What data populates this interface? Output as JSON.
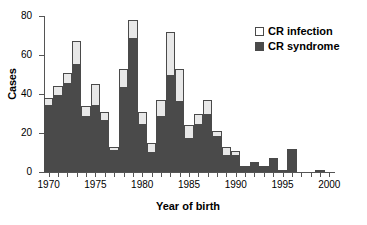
{
  "chart_data": {
    "type": "bar",
    "subtype": "stacked",
    "title": "",
    "xlabel": "Year of birth",
    "ylabel": "Cases",
    "xlim": [
      1969.5,
      2000.5
    ],
    "ylim": [
      0,
      80
    ],
    "yticks": [
      0,
      20,
      40,
      60,
      80
    ],
    "ytick_labels": [
      "0",
      "20",
      "40",
      "60",
      "80"
    ],
    "xtick_labels": [
      "1970",
      "1975",
      "1980",
      "1985",
      "1990",
      "1995",
      "2000"
    ],
    "xticks_major": [
      1970,
      1975,
      1980,
      1985,
      1990,
      1995,
      2000
    ],
    "xticks_minor_every": 1,
    "grid": false,
    "legend_position": "top-right",
    "categories": [
      "1970",
      "1971",
      "1972",
      "1973",
      "1974",
      "1975",
      "1976",
      "1977",
      "1978",
      "1979",
      "1980",
      "1981",
      "1982",
      "1983",
      "1984",
      "1985",
      "1986",
      "1987",
      "1988",
      "1989",
      "1990",
      "1991",
      "1992",
      "1993",
      "1994",
      "1995",
      "1996",
      "1997",
      "1998",
      "1999",
      "2000"
    ],
    "series": [
      {
        "name": "CR syndrome",
        "color": "#4a4a4a",
        "values": [
          34,
          39,
          45,
          55,
          28,
          34,
          26,
          11,
          43,
          68,
          24,
          10,
          28,
          49,
          36,
          17,
          24,
          29,
          18,
          8,
          8,
          3,
          5,
          2,
          6,
          1,
          11,
          0,
          0,
          1,
          0
        ]
      },
      {
        "name": "CR infection",
        "color": "#e8e8e8",
        "values": [
          4,
          5,
          6,
          12,
          6,
          11,
          5,
          2,
          10,
          10,
          7,
          5,
          9,
          23,
          17,
          7,
          6,
          8,
          3,
          5,
          3,
          0,
          0,
          1,
          1,
          0,
          1,
          0,
          0,
          0,
          0
        ]
      }
    ],
    "totals": [
      38,
      44,
      51,
      67,
      34,
      45,
      31,
      13,
      53,
      78,
      31,
      15,
      37,
      72,
      53,
      24,
      30,
      37,
      21,
      13,
      11,
      3,
      5,
      3,
      7,
      1,
      12,
      0,
      0,
      1,
      0
    ]
  },
  "legend": {
    "entries": [
      {
        "label": "CR infection",
        "swatch": "legend-swatch-infection"
      },
      {
        "label": "CR syndrome",
        "swatch": "legend-swatch-syndrome"
      }
    ]
  }
}
